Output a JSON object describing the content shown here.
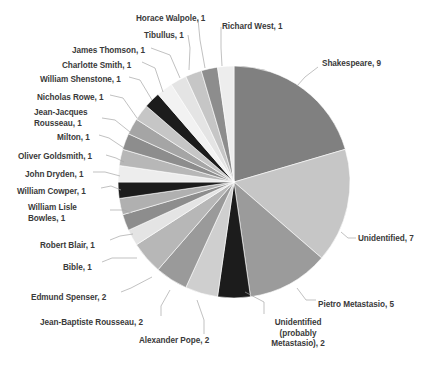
{
  "chart_data": {
    "type": "pie",
    "title": "",
    "subtitle": "",
    "xlabel": "",
    "ylabel": "",
    "legend_position": "none",
    "grid": false,
    "total": 44,
    "start_angle_deg": 0,
    "direction": "clockwise",
    "labels_show_name_and_value": true,
    "categories": [
      "Shakespeare",
      "Unidentified",
      "Pietro Metastasio",
      "Unidentified (probably Metastasio)",
      "Alexander Pope",
      "Jean-Baptiste Rousseau",
      "Edmund Spenser",
      "Bible",
      "Robert Blair",
      "William Lisle Bowles",
      "William Cowper",
      "John Dryden",
      "Oliver Goldsmith",
      "Milton",
      "Jean-Jacques Rousseau",
      "Nicholas Rowe",
      "William Shenstone",
      "Charlotte Smith",
      "James Thomson",
      "Tibullus",
      "Horace Walpole",
      "Richard West"
    ],
    "values": [
      9,
      7,
      5,
      2,
      2,
      2,
      2,
      1,
      1,
      1,
      1,
      1,
      1,
      1,
      1,
      1,
      1,
      1,
      1,
      1,
      1,
      1
    ],
    "colors": [
      "#808080",
      "#c6c6c6",
      "#9b9b9b",
      "#1c1c1c",
      "#cfcfcf",
      "#9a9a9a",
      "#b7b7b7",
      "#e4e4e4",
      "#8d8d8d",
      "#b0b0b0",
      "#1c1c1c",
      "#ededed",
      "#b7b7b7",
      "#8d8d8d",
      "#a5a5a5",
      "#c6c6c6",
      "#1c1c1c",
      "#f2f2f2",
      "#e4e4e4",
      "#c6c6c6",
      "#8d8d8d",
      "#ededed"
    ],
    "data_labels": [
      {
        "key": "shakespeare",
        "text": "Shakespeare, 9"
      },
      {
        "key": "unidentified",
        "text": "Unidentified, 7"
      },
      {
        "key": "pietro-metastasio",
        "text": "Pietro Metastasio, 5"
      },
      {
        "key": "unidentified-probably-metastasio",
        "text": "Unidentified\n(probably\nMetastasio), 2"
      },
      {
        "key": "alexander-pope",
        "text": "Alexander Pope, 2"
      },
      {
        "key": "jean-baptiste-rousseau",
        "text": "Jean-Baptiste Rousseau, 2"
      },
      {
        "key": "edmund-spenser",
        "text": "Edmund Spenser, 2"
      },
      {
        "key": "bible",
        "text": "Bible, 1"
      },
      {
        "key": "robert-blair",
        "text": "Robert Blair, 1"
      },
      {
        "key": "william-lisle-bowles",
        "text": "William Lisle\nBowles, 1"
      },
      {
        "key": "william-cowper",
        "text": "William Cowper, 1"
      },
      {
        "key": "john-dryden",
        "text": "John Dryden, 1"
      },
      {
        "key": "oliver-goldsmith",
        "text": "Oliver Goldsmith, 1"
      },
      {
        "key": "milton",
        "text": "Milton, 1"
      },
      {
        "key": "jean-jacques-rousseau",
        "text": "Jean-Jacques\nRousseau, 1"
      },
      {
        "key": "nicholas-rowe",
        "text": "Nicholas Rowe, 1"
      },
      {
        "key": "william-shenstone",
        "text": "William Shenstone, 1"
      },
      {
        "key": "charlotte-smith",
        "text": "Charlotte Smith, 1"
      },
      {
        "key": "james-thomson",
        "text": "James Thomson, 1"
      },
      {
        "key": "tibullus",
        "text": "Tibullus, 1"
      },
      {
        "key": "horace-walpole",
        "text": "Horace Walpole, 1"
      },
      {
        "key": "richard-west",
        "text": "Richard West, 1"
      }
    ]
  },
  "geometry": {
    "cx": 234,
    "cy": 182,
    "r": 116
  },
  "label_layout": [
    {
      "key": "shakespeare",
      "x": 322,
      "y": 59,
      "align": "l",
      "leader": [
        [
          318,
          67
        ],
        [
          305,
          77
        ],
        [
          297,
          86
        ]
      ]
    },
    {
      "key": "unidentified",
      "x": 358,
      "y": 234,
      "align": "l",
      "leader": [
        [
          356,
          238
        ],
        [
          348,
          238
        ],
        [
          341,
          232
        ]
      ]
    },
    {
      "key": "pietro-metastasio",
      "x": 318,
      "y": 300,
      "align": "l",
      "leader": [
        [
          316,
          300
        ],
        [
          306,
          300
        ],
        [
          297,
          288
        ]
      ]
    },
    {
      "key": "unidentified-probably-metastasio",
      "x": 233,
      "y": 318,
      "align": "c",
      "leader": [
        [
          264,
          314
        ],
        [
          264,
          302
        ],
        [
          245,
          292
        ]
      ]
    },
    {
      "key": "alexander-pope",
      "x": 139,
      "y": 336,
      "align": "l",
      "leader": [
        [
          204,
          334
        ],
        [
          204,
          320
        ],
        [
          197,
          300
        ]
      ]
    },
    {
      "key": "jean-baptiste-rousseau",
      "x": 40,
      "y": 318,
      "align": "l",
      "leader": [
        [
          161,
          316
        ],
        [
          161,
          306
        ],
        [
          170,
          290
        ]
      ]
    },
    {
      "key": "edmund-spenser",
      "x": 31,
      "y": 293,
      "align": "l",
      "leader": [
        [
          121,
          292
        ],
        [
          131,
          288
        ],
        [
          152,
          277
        ]
      ]
    },
    {
      "key": "bible",
      "x": 63,
      "y": 263,
      "align": "l",
      "leader": [
        [
          102,
          262
        ],
        [
          112,
          258
        ],
        [
          137,
          258
        ]
      ]
    },
    {
      "key": "robert-blair",
      "x": 40,
      "y": 241,
      "align": "l",
      "leader": [
        [
          110,
          240
        ],
        [
          120,
          236
        ],
        [
          133,
          234
        ]
      ]
    },
    {
      "key": "william-lisle-bowles",
      "x": 28,
      "y": 203,
      "align": "l",
      "leader": [
        [
          110,
          210
        ],
        [
          124,
          210
        ],
        [
          131,
          213
        ]
      ]
    },
    {
      "key": "william-cowper",
      "x": 17,
      "y": 187,
      "align": "l",
      "leader": [
        [
          101,
          188
        ],
        [
          111,
          186
        ],
        [
          121,
          190
        ]
      ]
    },
    {
      "key": "john-dryden",
      "x": 25,
      "y": 170,
      "align": "l",
      "leader": [
        [
          93,
          172
        ],
        [
          105,
          172
        ],
        [
          120,
          176
        ]
      ]
    },
    {
      "key": "oliver-goldsmith",
      "x": 18,
      "y": 152,
      "align": "l",
      "leader": [
        [
          106,
          155
        ],
        [
          116,
          158
        ],
        [
          124,
          162
        ]
      ]
    },
    {
      "key": "milton",
      "x": 57,
      "y": 133,
      "align": "l",
      "leader": [
        [
          99,
          135
        ],
        [
          109,
          138
        ],
        [
          124,
          148
        ]
      ]
    },
    {
      "key": "jean-jacques-rousseau",
      "x": 34,
      "y": 108,
      "align": "l",
      "leader": [
        [
          102,
          118
        ],
        [
          115,
          120
        ],
        [
          130,
          132
        ]
      ]
    },
    {
      "key": "nicholas-rowe",
      "x": 37,
      "y": 93,
      "align": "l",
      "leader": [
        [
          110,
          95
        ],
        [
          123,
          98
        ],
        [
          137,
          118
        ]
      ]
    },
    {
      "key": "william-shenstone",
      "x": 40,
      "y": 75,
      "align": "l",
      "leader": [
        [
          129,
          77
        ],
        [
          140,
          80
        ],
        [
          152,
          100
        ]
      ]
    },
    {
      "key": "charlotte-smith",
      "x": 62,
      "y": 61,
      "align": "l",
      "leader": [
        [
          142,
          62
        ],
        [
          155,
          68
        ],
        [
          163,
          92
        ]
      ]
    },
    {
      "key": "james-thomson",
      "x": 72,
      "y": 46,
      "align": "l",
      "leader": [
        [
          151,
          48
        ],
        [
          170,
          55
        ],
        [
          180,
          78
        ]
      ]
    },
    {
      "key": "tibullus",
      "x": 144,
      "y": 31,
      "align": "l",
      "leader": [
        [
          188,
          35
        ],
        [
          190,
          48
        ],
        [
          189,
          70
        ]
      ]
    },
    {
      "key": "horace-walpole",
      "x": 136,
      "y": 14,
      "align": "l",
      "leader": [
        [
          198,
          19
        ],
        [
          200,
          40
        ],
        [
          205,
          68
        ]
      ]
    },
    {
      "key": "richard-west",
      "x": 222,
      "y": 22,
      "align": "l",
      "leader": [
        [
          221,
          27
        ],
        [
          221,
          48
        ],
        [
          222,
          66
        ]
      ]
    }
  ]
}
